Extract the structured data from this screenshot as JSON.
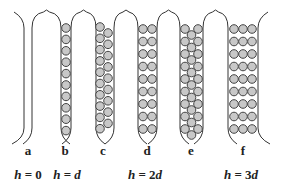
{
  "figure": {
    "panels": [
      {
        "id": "a",
        "label": "a",
        "columns": 0,
        "rows": 0,
        "arrangement": "empty"
      },
      {
        "id": "b",
        "label": "b",
        "columns": 1,
        "rows": 10,
        "arrangement": "single"
      },
      {
        "id": "c",
        "label": "c",
        "columns": 2,
        "rows": 10,
        "arrangement": "staggered"
      },
      {
        "id": "d",
        "label": "d",
        "columns": 2,
        "rows": 9,
        "arrangement": "square"
      },
      {
        "id": "e",
        "label": "e",
        "columns": 3,
        "rows": 9,
        "arrangement": "staggered-center"
      },
      {
        "id": "f",
        "label": "f",
        "columns": 3,
        "rows": 9,
        "arrangement": "square"
      }
    ],
    "h_labels": [
      {
        "var": "h",
        "eq": " = ",
        "val": "0",
        "under": "a"
      },
      {
        "var": "h",
        "eq": " = ",
        "val": "d",
        "val_italic": true,
        "under": "b"
      },
      {
        "var": "h",
        "eq": " = ",
        "val": "2d",
        "under": "d"
      },
      {
        "var": "h",
        "eq": " = ",
        "val": "3d",
        "under": "f"
      }
    ],
    "colors": {
      "wall_stroke": "#333333",
      "sphere_fill": "#c8c8c8",
      "sphere_stroke": "#444444",
      "text": "#222222"
    }
  },
  "labels": {
    "a": "a",
    "b": "b",
    "c": "c",
    "d": "d",
    "e": "e",
    "f": "f",
    "h0": "h = 0",
    "hd_var": "h",
    "hd_eq": " = ",
    "hd_val": "d",
    "h2d_var": "h",
    "h2d_eq": " = 2",
    "h2d_val": "d",
    "h3d_var": "h",
    "h3d_eq": " = 3",
    "h3d_val": "d",
    "h0_var": "h",
    "h0_eq": " = 0"
  }
}
